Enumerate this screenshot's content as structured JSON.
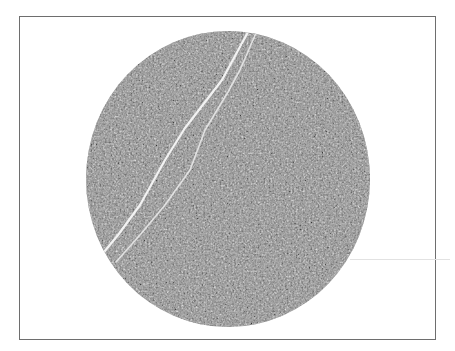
{
  "image": {
    "description": "Circular grayscale CT-like cross-section with a diagonal crack (two thin white lines) inside a thin rectangular frame",
    "frame": {
      "x": 19,
      "y": 16,
      "width": 417,
      "height": 324,
      "border_color": "#6e6e6e"
    },
    "specimen": {
      "cx": 228,
      "cy": 179,
      "rx": 142,
      "ry": 148,
      "base_color": "#8a8a8a"
    },
    "cracks": [
      {
        "name": "crack-primary",
        "points": "248,32 222,80 185,128 165,160 140,205 118,235 104,252",
        "color": "#f2f2f2",
        "width": 2.2
      },
      {
        "name": "crack-secondary",
        "points": "256,33 240,70 228,92 205,130 190,170 165,205 140,235 116,262",
        "color": "#e8e8e8",
        "width": 1.6
      }
    ],
    "colors": {
      "background": "#ffffff",
      "texture_dark": "#3a3a3a",
      "texture_light": "#d0d0d0"
    }
  }
}
